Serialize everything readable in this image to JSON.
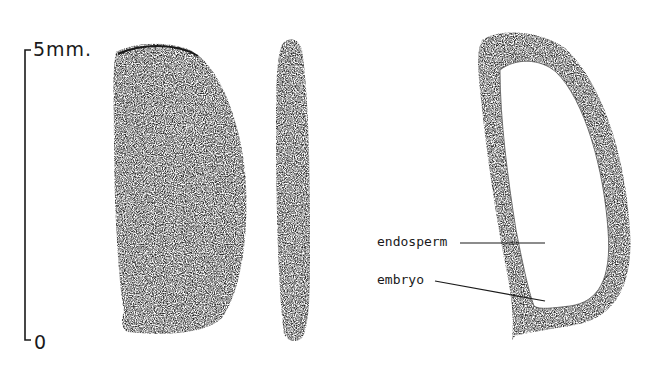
{
  "figure": {
    "scale_bar": {
      "top_label": "5mm.",
      "bottom_label": "0"
    },
    "views": [
      {
        "name": "seed-face-view"
      },
      {
        "name": "seed-side-view"
      },
      {
        "name": "seed-longitudinal-section"
      }
    ],
    "labels": {
      "endosperm": "endosperm",
      "embryo": "embryo"
    },
    "colors": {
      "ink": "#1a1a1a",
      "background": "#ffffff",
      "stipple_dark": "#2b2b2b",
      "stipple_mid": "#6a6a6a"
    }
  }
}
